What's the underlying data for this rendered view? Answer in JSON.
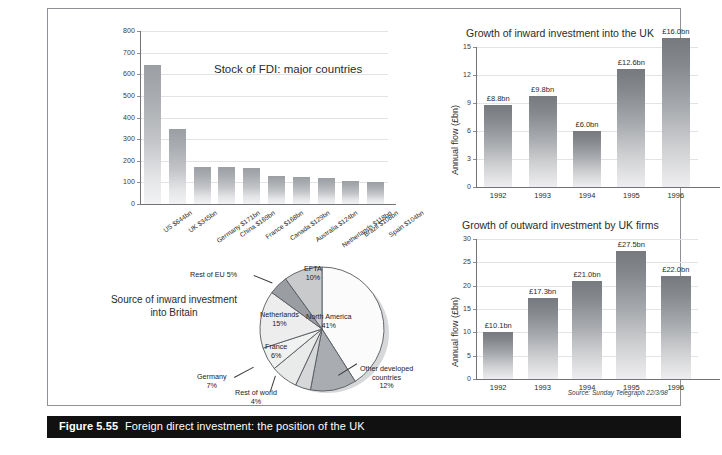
{
  "figure": {
    "number_label": "Figure 5.55",
    "caption": "Foreign direct investment: the position of the UK",
    "source_note": "Source: Sunday Telegraph 22/3/98"
  },
  "chart_data": [
    {
      "id": "stock-of-fdi",
      "type": "bar",
      "title": "Stock of FDI: major countries",
      "xlabel": "",
      "ylabel": "",
      "ylim": [
        0,
        800
      ],
      "yticks": [
        0,
        100,
        200,
        300,
        400,
        500,
        600,
        700,
        800
      ],
      "grid": true,
      "categories": [
        "US $644bn",
        "UK $345bn",
        "Germany $171bn",
        "China $169bn",
        "France $168bn",
        "Canada $129bn",
        "Australia $124bn",
        "Netherlands $118bn",
        "Brazil $108bn",
        "Spain $104bn"
      ],
      "values": [
        644,
        345,
        171,
        169,
        168,
        129,
        124,
        118,
        108,
        104
      ]
    },
    {
      "id": "source-of-inward-investment",
      "type": "pie",
      "title": "Source of inward investment into Britain",
      "categories": [
        "North America",
        "Other developed countries",
        "Rest of world",
        "Germany",
        "France",
        "Netherlands",
        "Rest of EU",
        "EFTA"
      ],
      "values": [
        41,
        12,
        4,
        7,
        6,
        15,
        5,
        10
      ],
      "value_labels": [
        "41%",
        "12%",
        "4%",
        "7%",
        "6%",
        "15%",
        "5%",
        "10%"
      ],
      "legend": "labelled-slices"
    },
    {
      "id": "inward-investment-uk",
      "type": "bar",
      "title": "Growth of inward investment into the UK",
      "xlabel": "",
      "ylabel": "Annual flow (£bn)",
      "ylim": [
        0,
        15
      ],
      "yticks": [
        0,
        3,
        6,
        9,
        12,
        15
      ],
      "grid": true,
      "categories": [
        "1992",
        "1993",
        "1994",
        "1995",
        "1996"
      ],
      "values": [
        8.8,
        9.8,
        6.0,
        12.6,
        16.0
      ],
      "data_labels": [
        "£8.8bn",
        "£9.8bn",
        "£6.0bn",
        "£12.6bn",
        "£16.0bn"
      ]
    },
    {
      "id": "outward-investment-uk-firms",
      "type": "bar",
      "title": "Growth of outward investment by UK firms",
      "xlabel": "",
      "ylabel": "Annual flow (£bn)",
      "ylim": [
        0,
        30
      ],
      "yticks": [
        0,
        5,
        10,
        15,
        20,
        25,
        30
      ],
      "grid": true,
      "categories": [
        "1992",
        "1993",
        "1994",
        "1995",
        "1996"
      ],
      "values": [
        10.1,
        17.3,
        21.0,
        27.5,
        22.0
      ],
      "data_labels": [
        "£10.1bn",
        "£17.3bn",
        "£21.0bn",
        "£27.5bn",
        "£22.0bn"
      ]
    }
  ],
  "colors": {
    "caption_bar": "#111111",
    "caption_text": "#ffffff",
    "bar_light": "#c3c5c8",
    "bar_dark": "#85888c",
    "grid": "#e2e3e5",
    "axis": "#6f7276"
  }
}
